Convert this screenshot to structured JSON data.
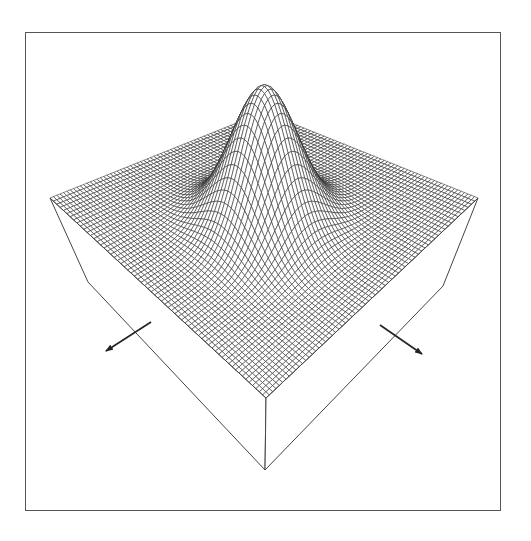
{
  "chart_data": {
    "type": "surface",
    "title": "",
    "function": "z = A * exp(-((u-0.5)^2 + (v-0.5)^2) / (2*sigma^2))",
    "grid": {
      "nu": 64,
      "nv": 64
    },
    "peak": {
      "u": 0.5,
      "v": 0.5,
      "height_px": 140,
      "sigma": 0.115
    },
    "projection": {
      "corner_left": [
        50,
        198
      ],
      "corner_back": [
        264,
        112
      ],
      "corner_right": [
        478,
        198
      ],
      "corner_front": [
        266,
        398
      ],
      "block_bottom_left": [
        88,
        282
      ],
      "block_bottom_right": [
        443,
        286
      ],
      "block_bottom_front": [
        265,
        470
      ]
    },
    "axes": {
      "arrow_left": {
        "from": [
          151,
          322
        ],
        "to": [
          106,
          351
        ],
        "label": ""
      },
      "arrow_right": {
        "from": [
          380,
          325
        ],
        "to": [
          422,
          354
        ],
        "label": ""
      }
    },
    "xlabel": "",
    "ylabel": "",
    "zlabel": "",
    "grid_lines": false,
    "legend": null
  },
  "colors": {
    "mesh_line": "#222222",
    "surface_fill": "#ffffff",
    "frame": "#555555",
    "block_edge": "#444444"
  }
}
